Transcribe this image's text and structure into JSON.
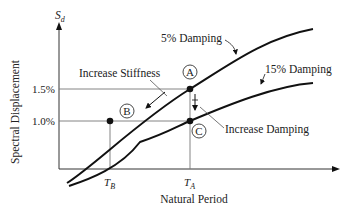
{
  "diagram": {
    "y_axis": {
      "symbol": "S",
      "subscript": "d",
      "label": "Spectral Displacement"
    },
    "x_axis": {
      "label": "Natural Period"
    },
    "y_ticks": [
      {
        "label": "1.5%",
        "value": 1.5
      },
      {
        "label": "1.0%",
        "value": 1.0
      }
    ],
    "x_ticks": [
      {
        "symbol": "T",
        "subscript": "B"
      },
      {
        "symbol": "T",
        "subscript": "A"
      }
    ],
    "curves": [
      {
        "name": "5% Damping",
        "label": "5% Damping"
      },
      {
        "name": "15% Damping",
        "label": "15% Damping"
      }
    ],
    "points": [
      {
        "label": "A",
        "description": "5% damping at period T_A, Sd = 1.5%"
      },
      {
        "label": "B",
        "description": "5% damping at period T_B, Sd = 1.0%"
      },
      {
        "label": "C",
        "description": "15% damping at period T_A, Sd = 1.0%"
      }
    ],
    "annotations": {
      "stiffness": "Increase Stiffness",
      "damping": "Increase Damping"
    },
    "colors": {
      "line": "#111111",
      "grid": "#777777",
      "text": "#222222"
    }
  }
}
